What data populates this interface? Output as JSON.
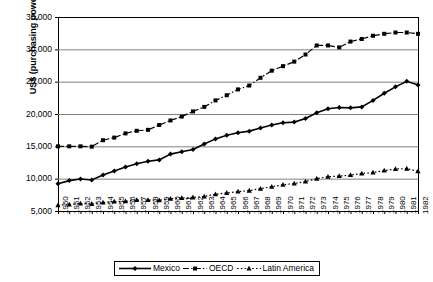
{
  "chart_data": {
    "type": "line",
    "title": "",
    "xlabel": "",
    "ylabel": "US$ (purchasing power parity)",
    "ylim": [
      5000,
      35000
    ],
    "ytick_labels": [
      "35,000",
      "30,000",
      "25,000",
      "20,000",
      "15,000",
      "10,000",
      "5,000"
    ],
    "ytick_values": [
      35000,
      30000,
      25000,
      20000,
      15000,
      10000,
      5000
    ],
    "grid": true,
    "legend_position": "bottom",
    "x": [
      1950,
      1951,
      1952,
      1953,
      1954,
      1955,
      1956,
      1957,
      1958,
      1959,
      1960,
      1961,
      1962,
      1963,
      1964,
      1965,
      1966,
      1967,
      1968,
      1969,
      1970,
      1971,
      1972,
      1973,
      1974,
      1975,
      1976,
      1977,
      1978,
      1979,
      1980,
      1981,
      1982
    ],
    "categories": [
      "1950",
      "1951",
      "1952",
      "1953",
      "1954",
      "1955",
      "1956",
      "1957",
      "1958",
      "1959",
      "1960",
      "1961",
      "1962",
      "1963",
      "1964",
      "1965",
      "1966",
      "1967",
      "1968",
      "1969",
      "1970",
      "1971",
      "1972",
      "1973",
      "1974",
      "1975",
      "1976",
      "1977",
      "1978",
      "1979",
      "1980",
      "1981",
      "1982"
    ],
    "series": [
      {
        "name": "Mexico",
        "marker": "diamond",
        "line_style": "solid",
        "color": "#000000",
        "values": [
          9200,
          9700,
          9950,
          9800,
          10550,
          11200,
          11800,
          12300,
          12700,
          12900,
          13800,
          14150,
          14500,
          15350,
          16150,
          16700,
          17100,
          17350,
          17850,
          18300,
          18650,
          18750,
          19300,
          20200,
          20800,
          21000,
          20950,
          21100,
          22100,
          23200,
          24200,
          25050,
          24500
        ]
      },
      {
        "name": "OECD",
        "marker": "square",
        "line_style": "dash-dot",
        "color": "#000000",
        "values": [
          15000,
          15000,
          15000,
          14950,
          15950,
          16350,
          17000,
          17400,
          17550,
          18300,
          19000,
          19600,
          20400,
          21100,
          22100,
          22900,
          23800,
          24400,
          25600,
          26700,
          27400,
          28100,
          29200,
          30600,
          30600,
          30300,
          31200,
          31600,
          32100,
          32400,
          32600,
          32600,
          32400
        ]
      },
      {
        "name": "Latin America",
        "marker": "triangle",
        "line_style": "dotted",
        "color": "#000000",
        "values": [
          5900,
          6000,
          6150,
          6100,
          6300,
          6450,
          6500,
          6700,
          6700,
          6650,
          6900,
          7000,
          7100,
          7250,
          7600,
          7800,
          8000,
          8150,
          8450,
          8750,
          9050,
          9250,
          9550,
          10000,
          10300,
          10400,
          10550,
          10800,
          10950,
          11250,
          11500,
          11550,
          11150
        ]
      }
    ]
  },
  "legend": {
    "items": [
      {
        "label": "Mexico"
      },
      {
        "label": "OECD"
      },
      {
        "label": "Latin America"
      }
    ]
  }
}
